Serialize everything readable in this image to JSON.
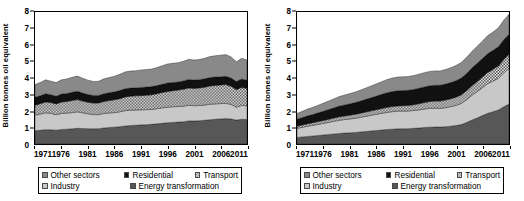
{
  "figure": {
    "ylabel": "Billion tonnes oil equivalent",
    "yticks": [
      "0",
      "1",
      "2",
      "3",
      "4",
      "5",
      "6",
      "7",
      "8"
    ],
    "xticks": [
      "1971",
      "1976",
      "1981",
      "1986",
      "1991",
      "1996",
      "2001",
      "2006",
      "2011"
    ],
    "legend": {
      "items": [
        {
          "key": "other_sectors",
          "label": "Other sectors",
          "swatch": "sw-other",
          "color": "#898989"
        },
        {
          "key": "residential",
          "label": "Residential",
          "swatch": "sw-resi",
          "color": "#111111"
        },
        {
          "key": "transport",
          "label": "Transport",
          "swatch": "sw-tran",
          "color": "#ffffff"
        },
        {
          "key": "industry",
          "label": "Industry",
          "swatch": "sw-indu",
          "color": "#c8c8c8"
        },
        {
          "key": "energy_transformation",
          "label": "Energy transformation",
          "swatch": "sw-ener",
          "color": "#575757"
        }
      ]
    }
  },
  "chart_data": [
    {
      "type": "area",
      "stacked": true,
      "title": "OECD countries",
      "xlabel": "",
      "ylabel": "Billion tonnes oil equivalent",
      "xlim": [
        1971,
        2011
      ],
      "ylim": [
        0,
        8
      ],
      "grid": false,
      "legend_position": "below",
      "x": [
        1971,
        1972,
        1973,
        1974,
        1975,
        1976,
        1977,
        1978,
        1979,
        1980,
        1981,
        1982,
        1983,
        1984,
        1985,
        1986,
        1987,
        1988,
        1989,
        1990,
        1991,
        1992,
        1993,
        1994,
        1995,
        1996,
        1997,
        1998,
        1999,
        2000,
        2001,
        2002,
        2003,
        2004,
        2005,
        2006,
        2007,
        2008,
        2009,
        2010,
        2011
      ],
      "series": [
        {
          "name": "Energy transformation",
          "stack_order": 1,
          "values": [
            0.8,
            0.83,
            0.87,
            0.86,
            0.84,
            0.88,
            0.9,
            0.92,
            0.95,
            0.94,
            0.93,
            0.92,
            0.93,
            0.97,
            1.0,
            1.02,
            1.05,
            1.09,
            1.12,
            1.14,
            1.16,
            1.17,
            1.19,
            1.22,
            1.25,
            1.29,
            1.31,
            1.33,
            1.35,
            1.4,
            1.4,
            1.41,
            1.44,
            1.47,
            1.5,
            1.52,
            1.54,
            1.52,
            1.45,
            1.5,
            1.48
          ]
        },
        {
          "name": "Industry",
          "stack_order": 2,
          "values": [
            0.95,
            0.98,
            1.02,
            1.0,
            0.93,
            0.97,
            0.97,
            0.98,
            1.0,
            0.95,
            0.9,
            0.86,
            0.85,
            0.88,
            0.88,
            0.88,
            0.9,
            0.93,
            0.93,
            0.92,
            0.91,
            0.91,
            0.9,
            0.92,
            0.94,
            0.94,
            0.95,
            0.94,
            0.94,
            0.95,
            0.92,
            0.92,
            0.92,
            0.94,
            0.93,
            0.93,
            0.92,
            0.88,
            0.78,
            0.84,
            0.83
          ]
        },
        {
          "name": "Transport",
          "stack_order": 3,
          "values": [
            0.6,
            0.63,
            0.66,
            0.65,
            0.66,
            0.69,
            0.71,
            0.74,
            0.74,
            0.71,
            0.7,
            0.7,
            0.71,
            0.73,
            0.75,
            0.78,
            0.8,
            0.83,
            0.85,
            0.86,
            0.86,
            0.88,
            0.89,
            0.91,
            0.93,
            0.95,
            0.97,
            1.0,
            1.03,
            1.05,
            1.05,
            1.07,
            1.08,
            1.11,
            1.12,
            1.13,
            1.14,
            1.1,
            1.07,
            1.08,
            1.07
          ]
        },
        {
          "name": "Residential",
          "stack_order": 4,
          "values": [
            0.48,
            0.49,
            0.5,
            0.48,
            0.47,
            0.49,
            0.48,
            0.5,
            0.51,
            0.49,
            0.47,
            0.46,
            0.45,
            0.47,
            0.48,
            0.48,
            0.49,
            0.5,
            0.49,
            0.48,
            0.5,
            0.49,
            0.5,
            0.49,
            0.5,
            0.52,
            0.5,
            0.49,
            0.5,
            0.51,
            0.51,
            0.5,
            0.51,
            0.51,
            0.51,
            0.49,
            0.5,
            0.5,
            0.49,
            0.52,
            0.49
          ]
        },
        {
          "name": "Other sectors",
          "stack_order": 5,
          "values": [
            0.77,
            0.8,
            0.84,
            0.82,
            0.82,
            0.86,
            0.88,
            0.9,
            0.92,
            0.9,
            0.87,
            0.85,
            0.86,
            0.9,
            0.92,
            0.95,
            0.98,
            1.02,
            1.03,
            1.04,
            1.06,
            1.06,
            1.07,
            1.09,
            1.12,
            1.15,
            1.16,
            1.17,
            1.19,
            1.22,
            1.21,
            1.22,
            1.24,
            1.27,
            1.29,
            1.31,
            1.32,
            1.28,
            1.19,
            1.25,
            1.22
          ]
        }
      ]
    },
    {
      "type": "area",
      "stacked": true,
      "title": "Non-OECD countries",
      "xlabel": "",
      "ylabel": "Billion tonnes oil equivalent",
      "xlim": [
        1971,
        2011
      ],
      "ylim": [
        0,
        8
      ],
      "grid": false,
      "legend_position": "below",
      "x": [
        1971,
        1972,
        1973,
        1974,
        1975,
        1976,
        1977,
        1978,
        1979,
        1980,
        1981,
        1982,
        1983,
        1984,
        1985,
        1986,
        1987,
        1988,
        1989,
        1990,
        1991,
        1992,
        1993,
        1994,
        1995,
        1996,
        1997,
        1998,
        1999,
        2000,
        2001,
        2002,
        2003,
        2004,
        2005,
        2006,
        2007,
        2008,
        2009,
        2010,
        2011
      ],
      "series": [
        {
          "name": "Energy transformation",
          "stack_order": 1,
          "values": [
            0.4,
            0.43,
            0.46,
            0.49,
            0.52,
            0.55,
            0.58,
            0.61,
            0.64,
            0.66,
            0.68,
            0.7,
            0.73,
            0.76,
            0.79,
            0.82,
            0.85,
            0.88,
            0.9,
            0.92,
            0.92,
            0.93,
            0.95,
            0.97,
            1.0,
            1.02,
            1.03,
            1.03,
            1.05,
            1.08,
            1.12,
            1.18,
            1.3,
            1.45,
            1.58,
            1.72,
            1.86,
            1.96,
            2.06,
            2.26,
            2.42
          ]
        },
        {
          "name": "Industry",
          "stack_order": 2,
          "values": [
            0.55,
            0.58,
            0.62,
            0.64,
            0.67,
            0.7,
            0.73,
            0.77,
            0.8,
            0.82,
            0.84,
            0.86,
            0.89,
            0.92,
            0.95,
            0.98,
            1.01,
            1.04,
            1.06,
            1.07,
            1.07,
            1.07,
            1.08,
            1.1,
            1.12,
            1.14,
            1.14,
            1.13,
            1.15,
            1.18,
            1.22,
            1.28,
            1.38,
            1.5,
            1.6,
            1.7,
            1.8,
            1.86,
            1.92,
            2.06,
            2.16
          ]
        },
        {
          "name": "Transport",
          "stack_order": 3,
          "values": [
            0.13,
            0.14,
            0.15,
            0.16,
            0.17,
            0.18,
            0.19,
            0.2,
            0.21,
            0.22,
            0.23,
            0.24,
            0.25,
            0.26,
            0.27,
            0.28,
            0.29,
            0.3,
            0.31,
            0.32,
            0.33,
            0.34,
            0.35,
            0.37,
            0.39,
            0.41,
            0.43,
            0.44,
            0.46,
            0.48,
            0.5,
            0.52,
            0.55,
            0.58,
            0.61,
            0.64,
            0.68,
            0.71,
            0.75,
            0.8,
            0.85
          ]
        },
        {
          "name": "Residential",
          "stack_order": 4,
          "values": [
            0.42,
            0.45,
            0.48,
            0.5,
            0.53,
            0.56,
            0.59,
            0.62,
            0.65,
            0.67,
            0.69,
            0.71,
            0.74,
            0.77,
            0.8,
            0.83,
            0.86,
            0.89,
            0.91,
            0.92,
            0.92,
            0.92,
            0.93,
            0.94,
            0.95,
            0.96,
            0.96,
            0.96,
            0.97,
            0.98,
            1.0,
            1.02,
            1.05,
            1.08,
            1.1,
            1.12,
            1.14,
            1.15,
            1.17,
            1.2,
            1.22
          ]
        },
        {
          "name": "Other sectors",
          "stack_order": 5,
          "values": [
            0.35,
            0.38,
            0.41,
            0.43,
            0.46,
            0.49,
            0.52,
            0.55,
            0.58,
            0.6,
            0.62,
            0.64,
            0.66,
            0.69,
            0.71,
            0.74,
            0.77,
            0.8,
            0.82,
            0.83,
            0.83,
            0.83,
            0.84,
            0.85,
            0.86,
            0.87,
            0.87,
            0.87,
            0.88,
            0.9,
            0.92,
            0.94,
            0.97,
            1.0,
            1.03,
            1.06,
            1.09,
            1.11,
            1.14,
            1.18,
            1.22
          ]
        }
      ]
    }
  ]
}
